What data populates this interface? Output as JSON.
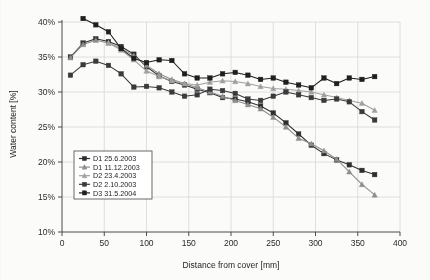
{
  "chart_data": {
    "type": "line",
    "title": "",
    "xlabel": "Distance from cover [mm]",
    "ylabel": "Water content [%]",
    "xlim": [
      0,
      400
    ],
    "ylim": [
      10,
      40
    ],
    "xticks": [
      0,
      50,
      100,
      150,
      200,
      250,
      300,
      350,
      400
    ],
    "yticks": [
      10,
      15,
      20,
      25,
      30,
      35,
      40
    ],
    "xticklabels": [
      "0",
      "50",
      "100",
      "150",
      "200",
      "250",
      "300",
      "350",
      "400"
    ],
    "yticklabels": [
      "10%",
      "15%",
      "20%",
      "25%",
      "30%",
      "35%",
      "40%"
    ],
    "grid": true,
    "legend_position": "lower-left-inside",
    "series": [
      {
        "name": "D1 25.6.2003",
        "color": "#2f2f2f",
        "marker": "square",
        "x": [
          10,
          25,
          40,
          55,
          70,
          85,
          100,
          115,
          130,
          145,
          160,
          175,
          190,
          205,
          220,
          235,
          250,
          265,
          280,
          295,
          310,
          325,
          340,
          355,
          370
        ],
        "y": [
          35.0,
          37.0,
          37.6,
          37.2,
          36.5,
          35.4,
          33.6,
          32.3,
          31.5,
          31.0,
          30.4,
          29.9,
          29.2,
          29.0,
          28.6,
          28.0,
          27.0,
          25.6,
          24.0,
          22.4,
          21.2,
          20.3,
          19.6,
          18.8,
          18.2
        ]
      },
      {
        "name": "D1 11.12.2003",
        "color": "#8e8e8e",
        "marker": "triangle",
        "x": [
          10,
          25,
          40,
          55,
          70,
          85,
          100,
          115,
          130,
          145,
          160,
          175,
          190,
          205,
          220,
          235,
          250,
          265,
          280,
          295,
          310,
          325,
          340,
          355,
          370
        ],
        "y": [
          34.9,
          36.8,
          37.4,
          37.0,
          36.2,
          35.2,
          33.8,
          32.6,
          31.8,
          31.2,
          30.6,
          30.0,
          29.4,
          28.8,
          28.2,
          27.6,
          26.4,
          25.0,
          23.4,
          22.6,
          21.6,
          20.4,
          18.6,
          16.8,
          15.3
        ]
      },
      {
        "name": "D2 23.4.2003",
        "color": "#a0a0a0",
        "marker": "triangle",
        "x": [
          55,
          70,
          85,
          100,
          115,
          130,
          145,
          160,
          175,
          190,
          205,
          220,
          235,
          250,
          265,
          280,
          295,
          310,
          325,
          340,
          355,
          370
        ],
        "y": [
          37.0,
          36.0,
          34.6,
          33.0,
          32.2,
          31.6,
          31.2,
          31.0,
          31.4,
          31.6,
          31.5,
          31.2,
          30.8,
          30.5,
          30.4,
          30.2,
          30.0,
          29.6,
          29.2,
          28.8,
          28.4,
          27.4
        ]
      },
      {
        "name": "D2 2.10.2003",
        "color": "#3a3a3a",
        "marker": "square",
        "x": [
          10,
          25,
          40,
          55,
          70,
          85,
          100,
          115,
          130,
          145,
          160,
          175,
          190,
          205,
          220,
          235,
          250,
          265,
          280,
          295,
          310,
          325,
          340,
          355,
          370
        ],
        "y": [
          32.4,
          33.9,
          34.4,
          33.8,
          32.6,
          30.7,
          30.8,
          30.6,
          30.0,
          29.4,
          29.6,
          30.4,
          30.2,
          29.8,
          29.0,
          28.8,
          29.4,
          30.0,
          29.6,
          29.2,
          28.8,
          29.0,
          28.6,
          27.2,
          26.0
        ]
      },
      {
        "name": "D3 31.5.2004",
        "color": "#1f1f1f",
        "marker": "square",
        "x": [
          25,
          40,
          55,
          70,
          85,
          100,
          115,
          130,
          145,
          160,
          175,
          190,
          205,
          220,
          235,
          250,
          265,
          280,
          295,
          310,
          325,
          340,
          355,
          370
        ],
        "y": [
          40.5,
          39.6,
          38.6,
          36.2,
          34.8,
          34.2,
          34.6,
          34.5,
          32.6,
          32.0,
          32.0,
          32.6,
          32.8,
          32.4,
          31.8,
          32.0,
          31.4,
          31.0,
          30.6,
          32.0,
          31.2,
          32.0,
          31.8,
          32.2
        ]
      }
    ]
  },
  "legend": {
    "items": [
      {
        "label": "D1 25.6.2003"
      },
      {
        "label": "D1 11.12.2003"
      },
      {
        "label": "D2 23.4.2003"
      },
      {
        "label": "D2 2.10.2003"
      },
      {
        "label": "D3 31.5.2004"
      }
    ]
  }
}
